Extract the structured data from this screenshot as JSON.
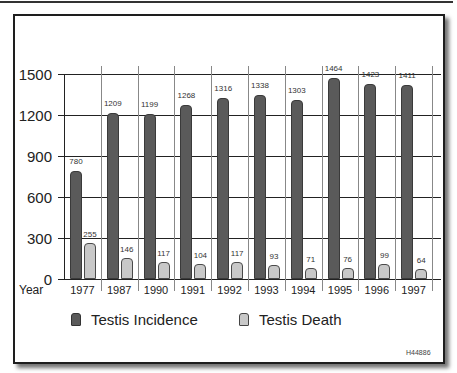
{
  "chart_data": {
    "type": "bar",
    "title": "",
    "xlabel": "Year",
    "ylabel": "",
    "ylim": [
      0,
      1500
    ],
    "yticks": [
      0,
      300,
      600,
      900,
      1200,
      1500
    ],
    "grid": true,
    "legend_position": "bottom",
    "categories": [
      "1977",
      "1987",
      "1990",
      "1991",
      "1992",
      "1993",
      "1994",
      "1995",
      "1996",
      "1997"
    ],
    "series": [
      {
        "name": "Testis Incidence",
        "color": "#5a5a5a",
        "values": [
          780,
          1209,
          1199,
          1268,
          1316,
          1338,
          1303,
          1464,
          1423,
          1411
        ]
      },
      {
        "name": "Testis Death",
        "color": "#c8c8c8",
        "values": [
          255,
          146,
          117,
          104,
          117,
          93,
          71,
          76,
          99,
          64
        ]
      }
    ],
    "annotations": [
      "H44886"
    ]
  },
  "axis": {
    "x_title": "Year",
    "yticks": [
      "1500",
      "1200",
      "900",
      "600",
      "300",
      "0"
    ]
  },
  "legend": {
    "incidence": "Testis Incidence",
    "death": "Testis Death"
  },
  "figure_code": "H44886"
}
